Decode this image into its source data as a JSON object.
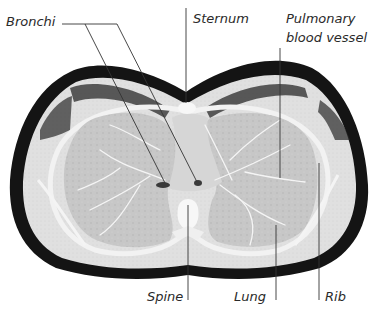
{
  "figure": {
    "type": "labelled CT cross-section of thorax",
    "labels": {
      "bronchi": "Bronchi",
      "sternum": "Sternum",
      "pulmonary_line1": "Pulmonary",
      "pulmonary_line2": "blood vessel",
      "spine": "Spine",
      "lung": "Lung",
      "rib": "Rib"
    },
    "colors": {
      "background": "#ffffff",
      "skin_outline": "#111111",
      "soft_tissue": "#dcdcdc",
      "lung_tissue": "#c4c4c4",
      "bone": "#f4f4f4",
      "leader_line": "#333333",
      "text": "#2a2a2a"
    }
  }
}
